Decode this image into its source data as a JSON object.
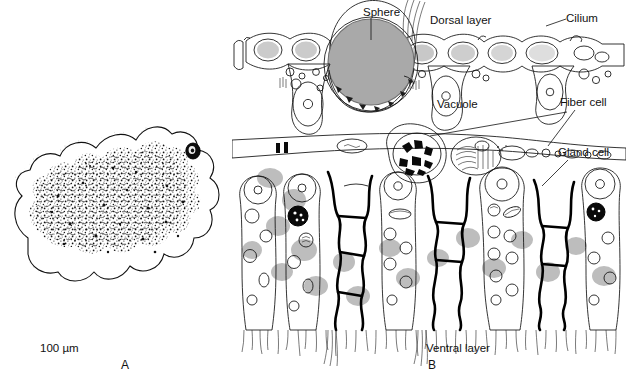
{
  "figure": {
    "type": "scientific-illustration",
    "background_color": "#ffffff",
    "line_color": "#111111",
    "sphere_fill": "#a9a9a9",
    "blob_fill": "#bdbdbd"
  },
  "panel_a": {
    "letter": "A",
    "scale_text": "100 µm",
    "content_note": "irregular amoeboid body outline with dense stippled granular interior and one small dark ring-shaped sphere near the upper right margin"
  },
  "panel_b": {
    "letter": "B",
    "labels": [
      {
        "id": "sphere",
        "text": "Sphere",
        "x": 363,
        "y": 6,
        "leader": "vertical"
      },
      {
        "id": "dorsal-layer",
        "text": "Dorsal layer",
        "x": 430,
        "y": 14,
        "leader": "none"
      },
      {
        "id": "cilium",
        "text": "Cilium",
        "x": 566,
        "y": 12,
        "leader": "horizontal"
      },
      {
        "id": "vacuole",
        "text": "Vacuole",
        "x": 437,
        "y": 98,
        "leader": "diagonal"
      },
      {
        "id": "fiber-cell",
        "text": "Fiber cell",
        "x": 560,
        "y": 96,
        "leader": "diagonal"
      },
      {
        "id": "gland-cell",
        "text": "Gland cell",
        "x": 558,
        "y": 146,
        "leader": "diagonal"
      },
      {
        "id": "ventral-layer",
        "text": "Ventral layer",
        "x": 426,
        "y": 342,
        "leader": "none"
      }
    ],
    "structures": {
      "dorsal_layer": "row of flattened epithelial cells with large oval gray-shaded vacuoles along the upper surface",
      "sphere": "large gray sphere enclosed in a stippled membrane, straddling the dorsal surface",
      "fiber_cell": "thin horizontal band of fiber cells spanning the middle of the section",
      "ventral_layer": "columnar cells with round nuclei, vesicles, gray elliptical blobs, thick black-outlined gland cells, and a ciliated ventral fringe"
    }
  }
}
